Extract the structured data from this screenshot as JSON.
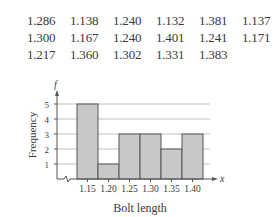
{
  "data_table": {
    "rows": [
      [
        "1.286",
        "1.138",
        "1.240",
        "1.132",
        "1.381",
        "1.137"
      ],
      [
        "1.300",
        "1.167",
        "1.240",
        "1.401",
        "1.241",
        "1.171"
      ],
      [
        "1.217",
        "1.360",
        "1.302",
        "1.331",
        "1.383"
      ]
    ]
  },
  "chart_data": {
    "type": "bar",
    "title": "",
    "xlabel": "Bolt length",
    "ylabel": "Frequency",
    "x_axis_symbol": "x",
    "y_axis_symbol": "f",
    "categories": [
      "1.15",
      "1.20",
      "1.25",
      "1.30",
      "1.35",
      "1.40"
    ],
    "values": [
      5,
      1,
      3,
      3,
      2,
      3
    ],
    "yticks": [
      "1",
      "2",
      "3",
      "4",
      "5"
    ],
    "ylim": [
      0,
      5.5
    ],
    "grid": true,
    "axis_break": true,
    "bar_color": "#c8c8c8",
    "bar_edge_color": "#555555",
    "grid_color": "#b0b0b0"
  }
}
